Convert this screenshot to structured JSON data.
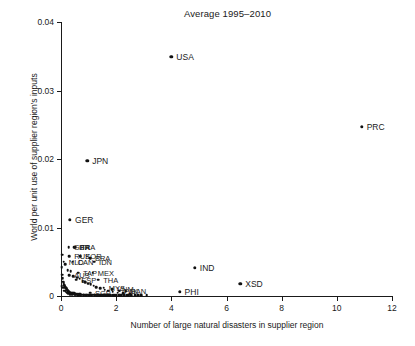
{
  "chart_data": {
    "type": "scatter",
    "title": "Average 1995–2010",
    "xlabel": "Number of large natural disasters in supplier region",
    "ylabel": "World per unit use of supplier region's inputs",
    "xlim": [
      0,
      12
    ],
    "ylim": [
      0,
      0.04
    ],
    "xticks": [
      "0",
      "2",
      "4",
      "6",
      "8",
      "10",
      "12"
    ],
    "xtick_values": [
      0,
      2,
      4,
      6,
      8,
      10,
      12
    ],
    "yticks": [
      "0",
      "0.01",
      "0.02",
      "0.03",
      "0.04"
    ],
    "ytick_values": [
      0,
      0.01,
      0.02,
      0.03,
      0.04
    ],
    "grid": false,
    "legend": "none",
    "marker_color": "#111111",
    "labeled_points": [
      {
        "label": "USA",
        "x": 4.0,
        "y": 0.0349
      },
      {
        "label": "PRC",
        "x": 10.9,
        "y": 0.0247
      },
      {
        "label": "JPN",
        "x": 0.95,
        "y": 0.0197
      },
      {
        "label": "GER",
        "x": 0.33,
        "y": 0.0111
      },
      {
        "label": "IND",
        "x": 4.85,
        "y": 0.0041
      },
      {
        "label": "XSD",
        "x": 6.5,
        "y": 0.0018
      },
      {
        "label": "PHI",
        "x": 4.3,
        "y": 0.0006
      },
      {
        "label": "FRA",
        "x": 0.52,
        "y": 0.0071
      },
      {
        "label": "ITA",
        "x": 0.47,
        "y": 0.0071
      },
      {
        "label": "GBR",
        "x": 0.28,
        "y": 0.0071
      },
      {
        "label": "KOR",
        "x": 0.7,
        "y": 0.0058
      },
      {
        "label": "RUS",
        "x": 0.3,
        "y": 0.0058
      },
      {
        "label": "BRA",
        "x": 1.05,
        "y": 0.0055
      },
      {
        "label": "CAN",
        "x": 0.42,
        "y": 0.005
      },
      {
        "label": "NLD",
        "x": 0.1,
        "y": 0.005
      },
      {
        "label": "IDN",
        "x": 1.2,
        "y": 0.005
      },
      {
        "label": "TAP",
        "x": 0.62,
        "y": 0.0034
      },
      {
        "label": "MEX",
        "x": 1.15,
        "y": 0.0034
      },
      {
        "label": "AUS",
        "x": 0.3,
        "y": 0.003
      },
      {
        "label": "THA",
        "x": 1.35,
        "y": 0.0024
      },
      {
        "label": "ESP",
        "x": 0.55,
        "y": 0.0024
      },
      {
        "label": "MYS",
        "x": 1.55,
        "y": 0.0012
      },
      {
        "label": "VNM",
        "x": 1.85,
        "y": 0.001
      },
      {
        "label": "PAK",
        "x": 2.1,
        "y": 0.0008
      },
      {
        "label": "BAN",
        "x": 2.35,
        "y": 0.0007
      },
      {
        "label": "SGP",
        "x": 1.05,
        "y": 0.0005
      }
    ],
    "unlabeled_points": [
      {
        "x": 0.02,
        "y": 0.0042
      },
      {
        "x": 0.04,
        "y": 0.0031
      },
      {
        "x": 0.06,
        "y": 0.0026
      },
      {
        "x": 0.08,
        "y": 0.0021
      },
      {
        "x": 0.1,
        "y": 0.0019
      },
      {
        "x": 0.12,
        "y": 0.0016
      },
      {
        "x": 0.14,
        "y": 0.0014
      },
      {
        "x": 0.16,
        "y": 0.0013
      },
      {
        "x": 0.18,
        "y": 0.0011
      },
      {
        "x": 0.2,
        "y": 0.001
      },
      {
        "x": 0.22,
        "y": 0.0009
      },
      {
        "x": 0.24,
        "y": 0.0008
      },
      {
        "x": 0.26,
        "y": 0.0007
      },
      {
        "x": 0.28,
        "y": 0.0006
      },
      {
        "x": 0.3,
        "y": 0.0006
      },
      {
        "x": 0.33,
        "y": 0.0005
      },
      {
        "x": 0.36,
        "y": 0.0005
      },
      {
        "x": 0.4,
        "y": 0.0004
      },
      {
        "x": 0.44,
        "y": 0.0004
      },
      {
        "x": 0.48,
        "y": 0.0004
      },
      {
        "x": 0.52,
        "y": 0.0003
      },
      {
        "x": 0.56,
        "y": 0.0003
      },
      {
        "x": 0.6,
        "y": 0.0003
      },
      {
        "x": 0.65,
        "y": 0.0003
      },
      {
        "x": 0.7,
        "y": 0.0003
      },
      {
        "x": 0.75,
        "y": 0.0002
      },
      {
        "x": 0.8,
        "y": 0.0002
      },
      {
        "x": 0.85,
        "y": 0.0002
      },
      {
        "x": 0.9,
        "y": 0.0002
      },
      {
        "x": 0.95,
        "y": 0.0002
      },
      {
        "x": 1.0,
        "y": 0.0002
      },
      {
        "x": 1.05,
        "y": 0.0002
      },
      {
        "x": 1.1,
        "y": 0.0002
      },
      {
        "x": 1.15,
        "y": 0.0002
      },
      {
        "x": 1.2,
        "y": 0.0002
      },
      {
        "x": 1.25,
        "y": 0.0002
      },
      {
        "x": 1.3,
        "y": 0.0001
      },
      {
        "x": 1.35,
        "y": 0.0001
      },
      {
        "x": 1.4,
        "y": 0.0001
      },
      {
        "x": 1.45,
        "y": 0.0001
      },
      {
        "x": 1.5,
        "y": 0.0001
      },
      {
        "x": 1.55,
        "y": 0.0001
      },
      {
        "x": 1.6,
        "y": 0.0001
      },
      {
        "x": 1.65,
        "y": 0.0001
      },
      {
        "x": 1.7,
        "y": 0.0001
      },
      {
        "x": 1.75,
        "y": 0.0001
      },
      {
        "x": 1.8,
        "y": 0.0001
      },
      {
        "x": 1.9,
        "y": 0.0001
      },
      {
        "x": 2.0,
        "y": 0.0001
      },
      {
        "x": 2.1,
        "y": 0.0001
      },
      {
        "x": 2.2,
        "y": 0.0001
      },
      {
        "x": 2.3,
        "y": 0.0001
      },
      {
        "x": 2.4,
        "y": 0.0001
      },
      {
        "x": 2.55,
        "y": 0.0001
      },
      {
        "x": 2.7,
        "y": 0.0001
      },
      {
        "x": 2.9,
        "y": 0.0001
      },
      {
        "x": 3.1,
        "y": 0.0001
      },
      {
        "x": 0.05,
        "y": 0.006
      },
      {
        "x": 0.15,
        "y": 0.0046
      },
      {
        "x": 0.25,
        "y": 0.0038
      },
      {
        "x": 0.35,
        "y": 0.0036
      },
      {
        "x": 0.45,
        "y": 0.0029
      },
      {
        "x": 0.58,
        "y": 0.0027
      },
      {
        "x": 0.68,
        "y": 0.0025
      },
      {
        "x": 0.78,
        "y": 0.0022
      },
      {
        "x": 0.88,
        "y": 0.002
      },
      {
        "x": 0.98,
        "y": 0.0018
      },
      {
        "x": 1.08,
        "y": 0.0017
      },
      {
        "x": 1.18,
        "y": 0.0015
      },
      {
        "x": 1.28,
        "y": 0.0013
      },
      {
        "x": 1.42,
        "y": 0.0011
      },
      {
        "x": 1.58,
        "y": 0.0009
      },
      {
        "x": 1.72,
        "y": 0.0008
      },
      {
        "x": 1.88,
        "y": 0.0006
      },
      {
        "x": 2.05,
        "y": 0.0005
      },
      {
        "x": 2.25,
        "y": 0.0004
      },
      {
        "x": 2.5,
        "y": 0.0003
      },
      {
        "x": 0.03,
        "y": 0.0014
      },
      {
        "x": 0.07,
        "y": 0.0012
      },
      {
        "x": 0.11,
        "y": 0.0008
      },
      {
        "x": 0.17,
        "y": 0.0007
      },
      {
        "x": 0.21,
        "y": 0.0005
      },
      {
        "x": 0.27,
        "y": 0.0004
      },
      {
        "x": 0.32,
        "y": 0.0003
      },
      {
        "x": 0.38,
        "y": 0.0003
      },
      {
        "x": 0.42,
        "y": 0.0002
      },
      {
        "x": 0.5,
        "y": 0.0002
      },
      {
        "x": 0.62,
        "y": 0.0001
      },
      {
        "x": 0.72,
        "y": 0.0001
      },
      {
        "x": 0.82,
        "y": 0.0001
      },
      {
        "x": 0.92,
        "y": 0.0001
      },
      {
        "x": 1.02,
        "y": 0.0001
      },
      {
        "x": 1.12,
        "y": 0.0001
      },
      {
        "x": 1.22,
        "y": 0.0001
      },
      {
        "x": 1.32,
        "y": 0.0001
      },
      {
        "x": 1.48,
        "y": 0.0001
      },
      {
        "x": 1.62,
        "y": 0.0001
      },
      {
        "x": 1.78,
        "y": 0.0001
      },
      {
        "x": 1.95,
        "y": 0.0001
      },
      {
        "x": 2.15,
        "y": 0.0001
      },
      {
        "x": 2.45,
        "y": 0.0001
      },
      {
        "x": 2.8,
        "y": 0.0001
      }
    ]
  }
}
